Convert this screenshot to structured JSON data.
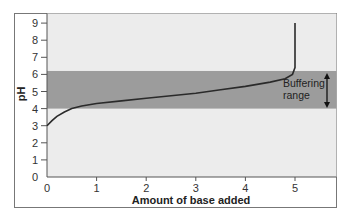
{
  "chart_data": {
    "type": "line",
    "title": "",
    "xlabel": "Amount of base added",
    "ylabel": "pH",
    "xlim": [
      0,
      5.85
    ],
    "ylim": [
      0,
      9
    ],
    "x_ticks": [
      "0",
      "1",
      "2",
      "3",
      "4",
      "5"
    ],
    "y_ticks": [
      "0",
      "1",
      "2",
      "3",
      "4",
      "5",
      "6",
      "7",
      "8",
      "9"
    ],
    "grid": false,
    "legend": null,
    "series": [
      {
        "name": "Titration curve",
        "x": [
          0,
          0.1,
          0.2,
          0.35,
          0.5,
          0.7,
          1.0,
          1.5,
          2.0,
          2.5,
          3.0,
          3.5,
          4.0,
          4.5,
          4.8,
          4.95,
          5.0,
          5.0
        ],
        "y": [
          3.0,
          3.3,
          3.55,
          3.8,
          4.0,
          4.15,
          4.3,
          4.45,
          4.6,
          4.75,
          4.9,
          5.1,
          5.3,
          5.55,
          5.75,
          6.0,
          6.4,
          9.0
        ]
      }
    ],
    "annotations": [
      {
        "type": "band",
        "y_from": 4.0,
        "y_to": 6.2,
        "label_lines": [
          "Buffering",
          "range"
        ],
        "arrow": "double-vertical"
      }
    ],
    "colors": {
      "plot_background": "#ececec",
      "band": "#9c9c9c",
      "line": "#2a2a2a",
      "frame": "#555555"
    }
  }
}
